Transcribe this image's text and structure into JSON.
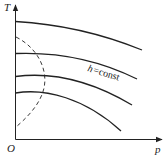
{
  "diagram": {
    "type": "line",
    "title": "",
    "axes": {
      "y_label": "T",
      "x_label": "p",
      "origin_label": "O"
    },
    "curve_label": {
      "text_h": "h",
      "text_rest": "=const"
    },
    "series": [
      {
        "name": "isenthalpic-1",
        "style": "solid"
      },
      {
        "name": "isenthalpic-2",
        "style": "solid"
      },
      {
        "name": "isenthalpic-3",
        "style": "solid"
      },
      {
        "name": "isenthalpic-4",
        "style": "solid"
      },
      {
        "name": "inversion-curve",
        "style": "dashed"
      }
    ],
    "colors": {
      "line": "#222222",
      "background": "#ffffff"
    }
  }
}
